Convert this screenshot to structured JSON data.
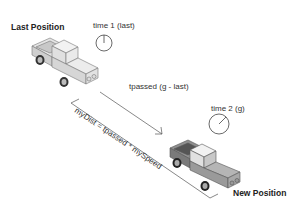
{
  "diagram": {
    "labels": {
      "last_position": "Last Position",
      "time1": "time 1 (last)",
      "tpassed": "tpassed (g - last)",
      "time2": "time 2 (g)",
      "mydist": "myDist = tpassed * mySpeed",
      "new_position": "New Position"
    },
    "colors": {
      "truck_last": "#d9d9d9",
      "truck_new": "#9a9a9a",
      "line": "#555555"
    }
  }
}
